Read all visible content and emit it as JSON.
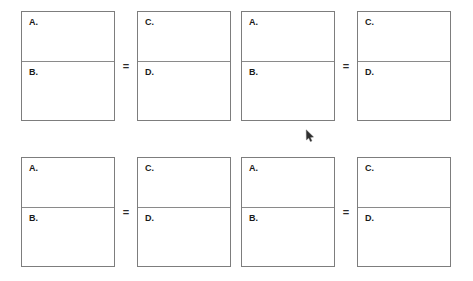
{
  "page": {
    "background_color": "#ffffff",
    "box_border_color": "#7d7d7d",
    "divider_color": "#8a8a8a",
    "label_color": "#1a1a1a",
    "operator_color": "#2b2b2b"
  },
  "rows": [
    {
      "equations": [
        {
          "left_box": {
            "numerator_label": "A.",
            "denominator_label": "B."
          },
          "operator": "=",
          "right_box": {
            "numerator_label": "C.",
            "denominator_label": "D."
          }
        },
        {
          "left_box": {
            "numerator_label": "A.",
            "denominator_label": "B."
          },
          "operator": "=",
          "right_box": {
            "numerator_label": "C.",
            "denominator_label": "D."
          }
        }
      ]
    },
    {
      "equations": [
        {
          "left_box": {
            "numerator_label": "A.",
            "denominator_label": "B."
          },
          "operator": "=",
          "right_box": {
            "numerator_label": "C.",
            "denominator_label": "D."
          }
        },
        {
          "left_box": {
            "numerator_label": "A.",
            "denominator_label": "B."
          },
          "operator": "=",
          "right_box": {
            "numerator_label": "C.",
            "denominator_label": "D."
          }
        }
      ]
    }
  ],
  "cursor": {
    "name": "mouse-pointer",
    "x": 305,
    "y": 129
  }
}
